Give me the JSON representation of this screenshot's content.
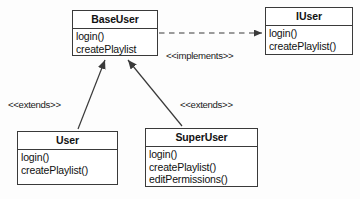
{
  "diagram": {
    "type": "uml-class-diagram",
    "background_color": "#fdfdfd",
    "line_color": "#3a3a3a",
    "text_color": "#111111"
  },
  "classes": [
    {
      "id": "baseuser",
      "name": "BaseUser",
      "members": [
        "login()",
        "createPlaylist"
      ]
    },
    {
      "id": "iuser",
      "name": "IUser",
      "members": [
        "login()",
        "createPlaylist()"
      ]
    },
    {
      "id": "user",
      "name": "User",
      "members": [
        "login()",
        "createPlaylist()"
      ]
    },
    {
      "id": "superuser",
      "name": "SuperUser",
      "members": [
        "login()",
        "createPlaylist()",
        "editPermissions()"
      ]
    }
  ],
  "relationships": [
    {
      "id": "implements",
      "label": "<<implements>>",
      "from": "BaseUser",
      "to": "IUser",
      "style": "dashed",
      "arrow": "open-arrowhead"
    },
    {
      "id": "extends-user",
      "label": "<<extends>>",
      "from": "User",
      "to": "BaseUser",
      "style": "solid",
      "arrow": "filled-triangle"
    },
    {
      "id": "extends-superuser",
      "label": "<<extends>>",
      "from": "SuperUser",
      "to": "BaseUser",
      "style": "solid",
      "arrow": "filled-triangle"
    }
  ]
}
